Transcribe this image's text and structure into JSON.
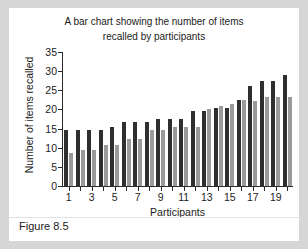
{
  "figure": {
    "caption": "Figure 8.5"
  },
  "chart_data": {
    "type": "bar",
    "title": "A bar chart showing the number of items recalled by participants",
    "title_line1": "A bar chart showing the number of items",
    "title_line2": "recalled by participants",
    "xlabel": "Participants",
    "ylabel": "Number of items recalled",
    "ylim": [
      0,
      35
    ],
    "yticks": [
      0,
      5,
      10,
      15,
      20,
      25,
      30,
      35
    ],
    "grid": false,
    "legend": "none",
    "categories": [
      1,
      2,
      3,
      4,
      5,
      6,
      7,
      8,
      9,
      10,
      11,
      12,
      13,
      14,
      15,
      16,
      17,
      18,
      19,
      20
    ],
    "xtick_labels": [
      "1",
      "3",
      "5",
      "7",
      "9",
      "11",
      "13",
      "15",
      "17",
      "19"
    ],
    "xtick_categories": [
      1,
      3,
      5,
      7,
      9,
      11,
      13,
      15,
      17,
      19
    ],
    "series": [
      {
        "name": "dark",
        "color": "#2f2f2f",
        "values": [
          14.6,
          14.6,
          14.6,
          14.6,
          15.4,
          16.6,
          16.6,
          16.6,
          17.5,
          17.5,
          17.5,
          19.6,
          19.5,
          20.4,
          20.4,
          22.5,
          26.2,
          27.4,
          27.4,
          29.1
        ]
      },
      {
        "name": "light",
        "color": "#9a9a9a",
        "values": [
          8.7,
          9.5,
          9.5,
          10.7,
          10.7,
          12.4,
          12.4,
          14.6,
          14.6,
          15.3,
          15.3,
          15.3,
          20.1,
          20.8,
          21.4,
          22.5,
          22.3,
          23.2,
          23.2,
          23.2
        ]
      }
    ]
  }
}
